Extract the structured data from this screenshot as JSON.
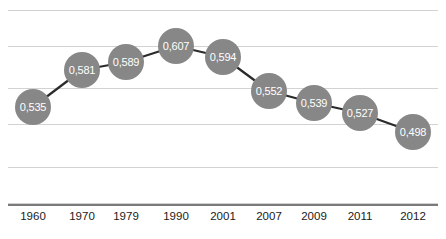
{
  "chart_data": {
    "type": "line",
    "title": "",
    "subtitle": "",
    "xlabel": "",
    "ylabel": "",
    "categories": [
      "1960",
      "1970",
      "1979",
      "1990",
      "2001",
      "2007",
      "2009",
      "2011",
      "2012"
    ],
    "values": [
      0.535,
      0.581,
      0.589,
      0.607,
      0.594,
      0.552,
      0.539,
      0.527,
      0.498
    ],
    "point_labels": [
      "0,535",
      "0,581",
      "0,589",
      "0,607",
      "0,594",
      "0,552",
      "0,539",
      "0,527",
      "0,498"
    ],
    "decimal_separator": ",",
    "ylim": [
      0.45,
      0.64
    ],
    "grid": true,
    "gridline_count": 6,
    "legend": "none",
    "marker": "circle",
    "marker_labels_inside": true,
    "colors": {
      "marker": "#878787",
      "marker_text": "#ffffff",
      "line": "#2b2b2b",
      "gridline": "#d2d2d2",
      "axis": "#7a7a7a",
      "tick_text": "#1a1a1a",
      "background": "#ffffff"
    },
    "points": [
      {
        "x": "1960",
        "label": "0,535",
        "value": 0.535,
        "px": 33,
        "py": 107
      },
      {
        "x": "1970",
        "label": "0,581",
        "value": 0.581,
        "px": 82,
        "py": 70
      },
      {
        "x": "1979",
        "label": "0,589",
        "value": 0.589,
        "px": 126,
        "py": 62
      },
      {
        "x": "1990",
        "label": "0,607",
        "value": 0.607,
        "px": 176,
        "py": 46
      },
      {
        "x": "2001",
        "label": "0,594",
        "value": 0.594,
        "px": 223,
        "py": 57
      },
      {
        "x": "2007",
        "label": "0,552",
        "value": 0.552,
        "px": 269,
        "py": 91
      },
      {
        "x": "2009",
        "label": "0,539",
        "value": 0.539,
        "px": 314,
        "py": 103
      },
      {
        "x": "2011",
        "label": "0,527",
        "value": 0.527,
        "px": 360,
        "py": 113
      },
      {
        "x": "2012",
        "label": "0,498",
        "value": 0.498,
        "px": 413,
        "py": 132
      }
    ],
    "gridlines_y": [
      10,
      46,
      88,
      124,
      167,
      203
    ]
  }
}
